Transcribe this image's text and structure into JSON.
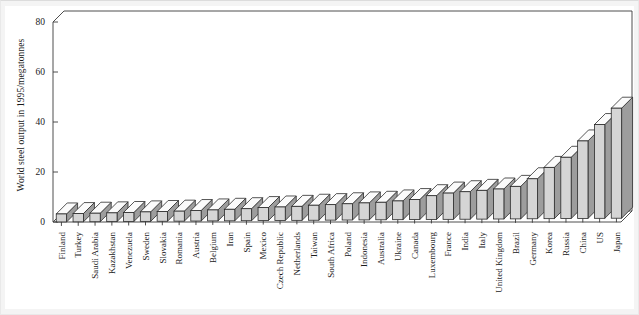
{
  "chart_data": {
    "type": "bar",
    "title": "",
    "subtitle": "",
    "xlabel": "",
    "ylabel": "World steel output in 1995/megatonnes",
    "ylim": [
      0,
      80
    ],
    "yticks": [
      0,
      20,
      40,
      60,
      80
    ],
    "ytick_labels": [
      "0",
      "20",
      "40",
      "60",
      "80"
    ],
    "grid": false,
    "legend": false,
    "style_note": "3D shaded vertical bars, sorted ascending",
    "categories": [
      "Finland",
      "Turkey",
      "Saudi Arabia",
      "Kazakhstan",
      "Venezuela",
      "Sweden",
      "Slovakia",
      "Romania",
      "Austria",
      "Belgium",
      "Iran",
      "Spain",
      "Mexico",
      "Czech Republic",
      "Netherlands",
      "Taiwan",
      "South Africa",
      "Poland",
      "Indonesia",
      "Australia",
      "Ukraine",
      "Canada",
      "Luxembourg",
      "France",
      "India",
      "Italy",
      "United Kingdom",
      "Brazil",
      "Germany",
      "Korea",
      "Russia",
      "China",
      "US",
      "Japan"
    ],
    "values": [
      3.2,
      3.3,
      3.4,
      3.5,
      3.6,
      3.8,
      3.9,
      4.0,
      4.2,
      4.4,
      4.6,
      4.8,
      5.2,
      5.4,
      5.6,
      6.0,
      6.2,
      6.5,
      6.8,
      7.0,
      7.5,
      8.0,
      9.5,
      10.5,
      11.0,
      11.5,
      12.0,
      13.0,
      16.0,
      20.5,
      24.5,
      31.0,
      37.5,
      44.0
    ],
    "value_axis_note": "values read from axis gridline positions, megatonnes"
  }
}
